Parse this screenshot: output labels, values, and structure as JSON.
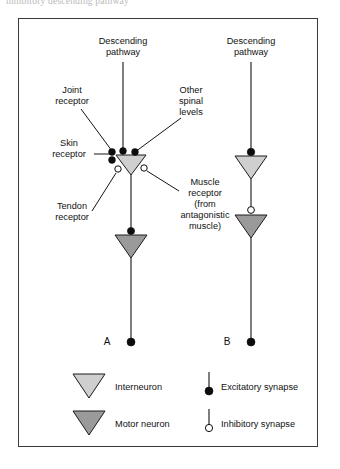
{
  "caption": {
    "partial_text": "inhibitory descending pathway"
  },
  "figure": {
    "panels": [
      {
        "id": "A",
        "letter": "A",
        "descending_label": "Descending\npathway",
        "descending_label_line1": "Descending",
        "descending_label_line2": "pathway",
        "interneuron_type": "interneuron",
        "motor_neuron_type": "motor neuron",
        "inputs": [
          {
            "name": "Joint receptor",
            "line1": "Joint",
            "line2": "receptor",
            "synapse": "excitatory"
          },
          {
            "name": "Skin receptor",
            "line1": "Skin",
            "line2": "receptor",
            "synapse": "excitatory"
          },
          {
            "name": "Other spinal levels",
            "line1": "Other",
            "line2": "spinal",
            "line3": "levels",
            "synapse": "excitatory"
          },
          {
            "name": "Tendon receptor",
            "line1": "Tendon",
            "line2": "receptor",
            "synapse": "inhibitory"
          },
          {
            "name": "Muscle receptor (from antagonistic muscle)",
            "line1": "Muscle",
            "line2": "receptor",
            "line3": "(from",
            "line4": "antagonistic",
            "line5": "muscle)",
            "synapse": "inhibitory"
          }
        ]
      },
      {
        "id": "B",
        "letter": "B",
        "descending_label_line1": "Descending",
        "descending_label_line2": "pathway",
        "interneuron_synapse": "excitatory",
        "motor_neuron_synapse": "inhibitory"
      }
    ],
    "legend": {
      "items": [
        {
          "key": "interneuron",
          "label": "Interneuron",
          "symbol": "light-gray-triangle"
        },
        {
          "key": "motor-neuron",
          "label": "Motor neuron",
          "symbol": "dark-gray-triangle"
        },
        {
          "key": "excitatory-synapse",
          "label": "Excitatory synapse",
          "symbol": "filled-circle-terminal"
        },
        {
          "key": "inhibitory-synapse",
          "label": "Inhibitory synapse",
          "symbol": "open-circle-terminal"
        }
      ]
    },
    "colors": {
      "interneuron_fill": "#cfcfcf",
      "motor_neuron_fill": "#9a9a9a",
      "excitatory_fill": "#0d0d0d",
      "inhibitory_fill": "#ffffff",
      "stroke": "#141414",
      "frame": "#3a3a3a"
    }
  }
}
